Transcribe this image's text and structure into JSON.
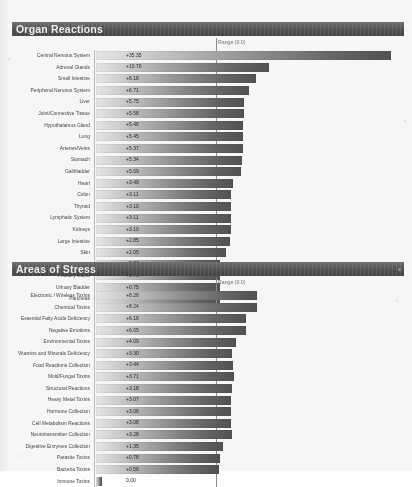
{
  "document": {
    "range_caption": "Range (0.0)"
  },
  "sections": [
    {
      "id": "organ",
      "title": "Organ Reactions"
    },
    {
      "id": "stress",
      "title": "Areas of Stress"
    }
  ],
  "chart_data": [
    {
      "type": "bar",
      "orientation": "horizontal",
      "title": "Organ Reactions",
      "xlabel": "",
      "ylabel": "",
      "grid": false,
      "legend": "none",
      "axis_caption": "Range (0.0)",
      "xlim": [
        0,
        36
      ],
      "categories": [
        "Central Nervous System",
        "Adrenal Glands",
        "Small Intestine",
        "Peripheral Nervous System",
        "Liver",
        "Joint/Connective Tissue",
        "Hypothalamus Gland",
        "Lung",
        "Arteries/Veins",
        "Stomach",
        "Gallbladder",
        "Heart",
        "Colon",
        "Thyroid",
        "Lymphatic System",
        "Kidneys",
        "Large Intestine",
        "Skin",
        "Spleen",
        "Pituitary Gland",
        "Urinary Bladder",
        "Pancreas"
      ],
      "values": [
        35.35,
        10.7,
        8.18,
        6.71,
        5.75,
        5.58,
        5.46,
        5.45,
        5.37,
        5.34,
        5.09,
        3.49,
        3.11,
        3.1,
        3.11,
        3.1,
        2.85,
        2.05,
        0.78,
        0.78,
        0.75,
        0.75
      ],
      "labels": [
        "+35.35",
        "+10.70",
        "+8.18",
        "+6.71",
        "+5.75",
        "+5.58",
        "+5.46",
        "+5.45",
        "+5.37",
        "+5.34",
        "+5.09",
        "+3.49",
        "+3.11",
        "+3.10",
        "+3.11",
        "+3.10",
        "+2.85",
        "+2.05",
        "+0.78",
        "+0.78",
        "+0.75",
        "+0.75"
      ]
    },
    {
      "type": "bar",
      "orientation": "horizontal",
      "title": "Areas of Stress",
      "xlabel": "",
      "ylabel": "",
      "grid": false,
      "legend": "none",
      "axis_caption": "Range (0.0)",
      "xlim": [
        0,
        36
      ],
      "categories": [
        "Electronic / Wireless Toxins",
        "Chemical Toxins",
        "Essential Fatty Acids Deficiency",
        "Negative Emotions",
        "Environmental Toxins",
        "Vitamins and Minerals Deficiency",
        "Food Reactions Collection",
        "Mold/Fungal Toxins",
        "Structural Reactions",
        "Heavy Metal Toxins",
        "Hormone Collection",
        "Cell Metabolism Reactions",
        "Neurotransmitter Collection",
        "Digestive Enzymes Collection",
        "Parasite Toxins",
        "Bacteria Toxins",
        "Immune Toxins"
      ],
      "values": [
        8.26,
        8.24,
        6.16,
        6.05,
        4.09,
        3.3,
        3.44,
        3.71,
        3.18,
        3.07,
        3.06,
        3.08,
        3.28,
        1.35,
        0.78,
        0.56,
        0.0
      ],
      "labels": [
        "+8.26",
        "+8.24",
        "+6.16",
        "+6.05",
        "+4.09",
        "+3.30",
        "+3.44",
        "+3.71",
        "+3.18",
        "+3.07",
        "+3.06",
        "+3.08",
        "+3.28",
        "+1.35",
        "+0.78",
        "+0.56",
        "0.00"
      ]
    }
  ]
}
